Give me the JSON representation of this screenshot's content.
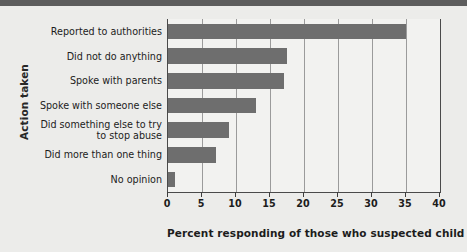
{
  "chart_data": {
    "type": "bar",
    "orientation": "horizontal",
    "title": "",
    "xlabel": "Percent responding of those who suspected child abuse",
    "ylabel": "Action taken",
    "xlim": [
      0,
      40
    ],
    "xticks": [
      0,
      5,
      10,
      15,
      20,
      25,
      30,
      35,
      40
    ],
    "xtick_labels": [
      "0",
      "5",
      "10",
      "15",
      "20",
      "25",
      "30",
      "35",
      "40"
    ],
    "grid": "vertical",
    "legend": "none",
    "bar_color": "#6e6e6e",
    "plot_background": "#f2f2f0",
    "figure_background": "#ececea",
    "categories": [
      "Reported to authorities",
      "Did not do anything",
      "Spoke with parents",
      "Spoke with someone else",
      "Did something else to try\nto stop abuse",
      "Did more than one thing",
      "No opinion"
    ],
    "category_labels": [
      "Reported to authorities",
      "Did not do anything",
      "Spoke with parents",
      "Spoke with someone else",
      "Did something else to try to stop abuse",
      "Did more than one thing",
      "No opinion"
    ],
    "values": [
      35,
      17.5,
      17,
      13,
      9,
      7,
      1
    ]
  }
}
